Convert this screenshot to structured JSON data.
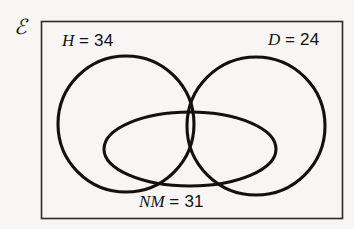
{
  "diagram": {
    "type": "venn",
    "universe": {
      "symbol": "ℰ",
      "name": "universal-set"
    },
    "stroke_color": "#111111",
    "background_color": "#f7f6f4",
    "sets": [
      {
        "id": "H",
        "shape": "circle",
        "symbol": "H",
        "equals": "= 34",
        "value": 34,
        "full_label": "H = 34",
        "cx": 126,
        "cy": 124,
        "r": 68
      },
      {
        "id": "D",
        "shape": "circle",
        "symbol": "D",
        "equals": "= 24",
        "value": 24,
        "full_label": "D = 24",
        "cx": 256,
        "cy": 126,
        "r": 69
      },
      {
        "id": "NM",
        "shape": "ellipse",
        "symbol": "NM",
        "equals": "= 31",
        "value": 31,
        "full_label": "NM = 31",
        "cx": 190,
        "cy": 149,
        "rx": 86,
        "ry": 37
      }
    ],
    "frame": {
      "name": "universal-set-rectangle",
      "x": 41,
      "y": 21,
      "width": 302,
      "height": 198
    }
  }
}
